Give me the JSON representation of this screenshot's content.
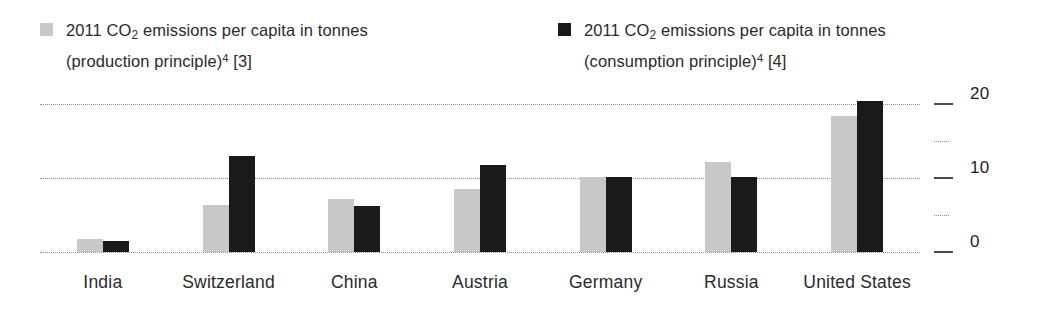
{
  "chart_data": {
    "type": "bar",
    "title": "",
    "subtitle": "",
    "xlabel": "",
    "ylabel": "",
    "ylim": [
      0,
      21.5
    ],
    "yticks": [
      {
        "value": 20,
        "label": "20",
        "major": true
      },
      {
        "value": 15,
        "label": "",
        "major": false
      },
      {
        "value": 10,
        "label": "10",
        "major": true
      },
      {
        "value": 5,
        "label": "",
        "major": false
      },
      {
        "value": 0,
        "label": "0",
        "major": true
      }
    ],
    "gridlines": [
      20,
      10,
      0
    ],
    "grid": true,
    "legend_position": "top",
    "categories": [
      "India",
      "Switzerland",
      "China",
      "Austria",
      "Germany",
      "Russia",
      "United States"
    ],
    "series": [
      {
        "name": "2011 CO2 emissions per capita in tonnes (production principle)4 [3]",
        "key": "production",
        "color": "#c8c8c8",
        "values": [
          1.7,
          6.3,
          7.2,
          8.5,
          10.2,
          12.2,
          18.4
        ]
      },
      {
        "name": "2011 CO2 emissions per capita in tonnes (consumption principle)4 [4]",
        "key": "consumption",
        "color": "#1a1a1a",
        "values": [
          1.5,
          13.0,
          6.2,
          11.8,
          10.2,
          10.2,
          20.4
        ]
      }
    ]
  },
  "legend": {
    "entries": [
      {
        "swatch": "gray",
        "color": "#c8c8c8",
        "year": "2011",
        "gas_prefix": "CO",
        "gas_sub": "2",
        "line1_tail": " emissions per capita in tonnes",
        "line2": "(production principle)",
        "line2_sup": "4",
        "line2_ref": " [3]"
      },
      {
        "swatch": "black",
        "color": "#1a1a1a",
        "year": "2011",
        "gas_prefix": "CO",
        "gas_sub": "2",
        "line1_tail": " emissions per capita in tonnes",
        "line2": "(consumption principle)",
        "line2_sup": "4",
        "line2_ref": " [4]"
      }
    ]
  },
  "colors": {
    "production": "#c8c8c8",
    "consumption": "#1a1a1a",
    "gridline": "#8c8c8c",
    "text": "#1e1e1e",
    "background": "#ffffff"
  }
}
